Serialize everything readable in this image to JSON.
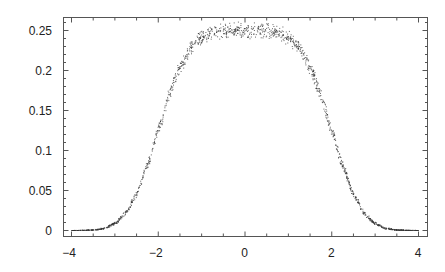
{
  "chart_data": {
    "type": "scatter",
    "title": "",
    "xlabel": "",
    "ylabel": "",
    "xlim": [
      -4,
      4
    ],
    "ylim": [
      0,
      0.26
    ],
    "grid": false,
    "legend": null,
    "frame": "box with ticks on all four sides",
    "x_ticks": [
      {
        "value": -4,
        "label": "-4"
      },
      {
        "value": -2,
        "label": "-2"
      },
      {
        "value": 0,
        "label": "0"
      },
      {
        "value": 2,
        "label": "2"
      },
      {
        "value": 4,
        "label": "4"
      }
    ],
    "y_ticks": [
      {
        "value": 0,
        "label": "0"
      },
      {
        "value": 0.05,
        "label": "0.05"
      },
      {
        "value": 0.1,
        "label": "0.1"
      },
      {
        "value": 0.15,
        "label": "0.15"
      },
      {
        "value": 0.2,
        "label": "0.2"
      },
      {
        "value": 0.25,
        "label": "0.25"
      }
    ],
    "x_minor_step": 0.5,
    "y_minor_step": 0.01,
    "series": [
      {
        "name": "density",
        "marker": "dot",
        "color": "#333333",
        "x": [
          -4.0,
          -3.75,
          -3.5,
          -3.25,
          -3.0,
          -2.75,
          -2.5,
          -2.25,
          -2.0,
          -1.75,
          -1.5,
          -1.25,
          -1.0,
          -0.75,
          -0.5,
          -0.25,
          0.0,
          0.25,
          0.5,
          0.75,
          1.0,
          1.25,
          1.5,
          1.75,
          2.0,
          2.25,
          2.5,
          2.75,
          3.0,
          3.25,
          3.5,
          3.75,
          4.0
        ],
        "y": [
          0.0,
          0.0001,
          0.0006,
          0.0025,
          0.0086,
          0.0214,
          0.0456,
          0.0813,
          0.125,
          0.1687,
          0.2044,
          0.2286,
          0.2414,
          0.2475,
          0.2494,
          0.2499,
          0.25,
          0.2499,
          0.2494,
          0.2475,
          0.2414,
          0.2286,
          0.2044,
          0.1687,
          0.125,
          0.0813,
          0.0456,
          0.0214,
          0.0086,
          0.0025,
          0.0006,
          0.0001,
          0.0
        ],
        "noise_amplitude": 0.011
      }
    ]
  }
}
